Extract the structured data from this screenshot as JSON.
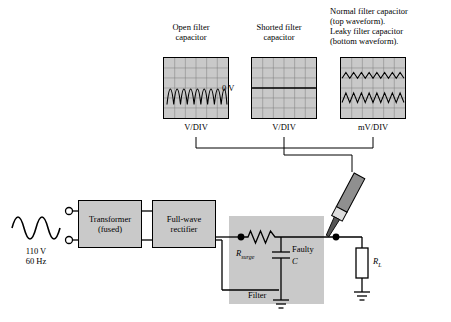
{
  "scopes": [
    {
      "id": "open-filter-capacitor",
      "caption": "Open filter\ncapacitor",
      "units": "V/DIV",
      "waveform": "full-wave-rectified-unfiltered"
    },
    {
      "id": "shorted-filter-capacitor",
      "caption": "Shorted filter\ncapacitor",
      "units": "V/DIV",
      "waveform": "flat-zero-line",
      "zero_label": "0 V"
    },
    {
      "id": "normal-and-leaky-filter-capacitor",
      "caption": "Normal filter capacitor\n(top waveform).\nLeaky filter capacitor\n(bottom waveform).",
      "units": "mV/DIV",
      "waveform": "two-ripple-traces"
    }
  ],
  "source": {
    "voltage": "110 V",
    "frequency": "60 Hz"
  },
  "blocks": [
    {
      "id": "transformer",
      "line1": "Transformer",
      "line2": "(fused)"
    },
    {
      "id": "rectifier",
      "line1": "Full-wave",
      "line2": "rectifier"
    }
  ],
  "filter": {
    "label": "Filter",
    "resistor": {
      "symbol": "R",
      "subscript": "surge"
    },
    "capacitor": {
      "line1": "Faulty",
      "symbol": "C"
    }
  },
  "load": {
    "symbol": "R",
    "subscript": "L"
  },
  "probe": {
    "name": "oscilloscope-probe"
  }
}
